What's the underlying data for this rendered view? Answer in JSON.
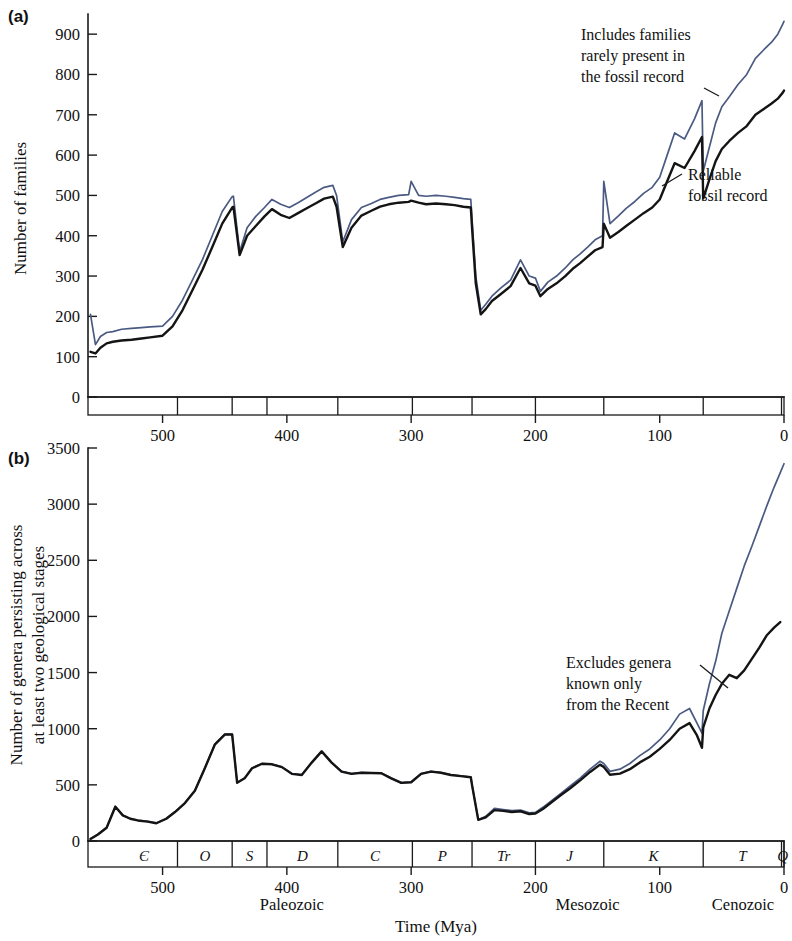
{
  "figure": {
    "panel_a_letter": "(a)",
    "panel_b_letter": "(b)",
    "x_axis_title": "Time (Mya)"
  },
  "panel_a": {
    "ylabel": "Number of families",
    "y_ticks": [
      "0",
      "100",
      "200",
      "300",
      "400",
      "500",
      "600",
      "700",
      "800",
      "900"
    ],
    "x_ticks": [
      "500",
      "400",
      "300",
      "200",
      "100",
      "0"
    ],
    "annotation_upper": [
      "Includes families",
      "rarely present in",
      "the fossil record"
    ],
    "annotation_lower": [
      "Reliable",
      "fossil record"
    ]
  },
  "panel_b": {
    "ylabel_line1": "Number of genera persisting across",
    "ylabel_line2": "at least two geological stages",
    "y_ticks": [
      "0",
      "500",
      "1000",
      "1500",
      "2000",
      "2500",
      "3000",
      "3500"
    ],
    "x_ticks": [
      "500",
      "400",
      "300",
      "200",
      "100",
      "0"
    ],
    "annotation": [
      "Excludes genera",
      "known only",
      "from the Recent"
    ],
    "periods": [
      {
        "symbol": "Є",
        "start": 542,
        "end": 488
      },
      {
        "symbol": "O",
        "start": 488,
        "end": 444
      },
      {
        "symbol": "S",
        "start": 444,
        "end": 416
      },
      {
        "symbol": "D",
        "start": 416,
        "end": 359
      },
      {
        "symbol": "C",
        "start": 359,
        "end": 299
      },
      {
        "symbol": "P",
        "start": 299,
        "end": 251
      },
      {
        "symbol": "Tr",
        "start": 251,
        "end": 200
      },
      {
        "symbol": "J",
        "start": 200,
        "end": 145
      },
      {
        "symbol": "K",
        "start": 145,
        "end": 65
      },
      {
        "symbol": "T",
        "start": 65,
        "end": 2
      },
      {
        "symbol": "Q",
        "start": 2,
        "end": 0
      }
    ],
    "eras": [
      {
        "label": "Paleozoic",
        "center_mya": 396
      },
      {
        "label": "Mesozoic",
        "center_mya": 158
      },
      {
        "label": "Cenozoic",
        "center_mya": 33
      }
    ]
  },
  "colors": {
    "curve_total": "#4a5a82",
    "curve_reliable": "#141414",
    "axis": "#1a1a1a",
    "background": "#ffffff"
  },
  "chart_data": [
    {
      "type": "line",
      "panel": "(a)",
      "title": "",
      "xlabel": "Time (Mya)",
      "ylabel": "Number of families",
      "xlim": [
        560,
        0
      ],
      "ylim": [
        0,
        950
      ],
      "x_reversed": true,
      "grid": false,
      "legend": "annotations",
      "series": [
        {
          "name": "Includes families rarely present in the fossil record",
          "color": "#4a5a82",
          "x": [
            558,
            554,
            550,
            545,
            540,
            533,
            525,
            517,
            510,
            500,
            492,
            484,
            476,
            468,
            460,
            452,
            444,
            443,
            438,
            432,
            425,
            418,
            412,
            405,
            398,
            391,
            384,
            377,
            370,
            363,
            360,
            355,
            348,
            340,
            332,
            325,
            318,
            310,
            302,
            300,
            294,
            288,
            280,
            272,
            265,
            258,
            252,
            251,
            248,
            244,
            240,
            235,
            228,
            220,
            212,
            205,
            200,
            196,
            190,
            183,
            176,
            170,
            164,
            158,
            152,
            146,
            145,
            140,
            133,
            127,
            120,
            113,
            106,
            100,
            94,
            88,
            80,
            72,
            66,
            65,
            60,
            55,
            50,
            44,
            37,
            30,
            23,
            16,
            10,
            5,
            1,
            0
          ],
          "y": [
            205,
            130,
            150,
            160,
            162,
            168,
            170,
            172,
            174,
            176,
            200,
            240,
            290,
            340,
            400,
            460,
            497,
            498,
            360,
            420,
            448,
            470,
            490,
            478,
            470,
            482,
            495,
            508,
            520,
            525,
            500,
            385,
            440,
            470,
            480,
            490,
            495,
            500,
            502,
            535,
            500,
            498,
            500,
            498,
            495,
            492,
            490,
            440,
            300,
            215,
            230,
            250,
            270,
            290,
            340,
            300,
            295,
            262,
            285,
            300,
            320,
            340,
            355,
            372,
            390,
            400,
            535,
            430,
            450,
            468,
            485,
            505,
            520,
            545,
            600,
            655,
            640,
            690,
            735,
            560,
            620,
            680,
            720,
            745,
            775,
            800,
            840,
            862,
            880,
            900,
            925,
            932
          ]
        },
        {
          "name": "Reliable fossil record",
          "color": "#141414",
          "x": [
            558,
            554,
            550,
            545,
            540,
            533,
            525,
            517,
            510,
            500,
            492,
            484,
            476,
            468,
            460,
            452,
            444,
            443,
            438,
            432,
            425,
            418,
            412,
            405,
            398,
            391,
            384,
            377,
            370,
            363,
            360,
            355,
            348,
            340,
            332,
            325,
            318,
            310,
            302,
            300,
            294,
            288,
            280,
            272,
            265,
            258,
            252,
            251,
            248,
            244,
            240,
            235,
            228,
            220,
            212,
            205,
            200,
            196,
            190,
            183,
            176,
            170,
            164,
            158,
            152,
            146,
            145,
            140,
            133,
            127,
            120,
            113,
            106,
            100,
            94,
            88,
            80,
            72,
            66,
            65,
            60,
            55,
            50,
            44,
            37,
            30,
            23,
            16,
            10,
            5,
            1,
            0
          ],
          "y": [
            112,
            108,
            122,
            133,
            137,
            140,
            142,
            145,
            148,
            152,
            175,
            215,
            265,
            315,
            372,
            430,
            470,
            472,
            352,
            400,
            424,
            448,
            466,
            452,
            444,
            456,
            468,
            480,
            492,
            497,
            472,
            372,
            420,
            450,
            462,
            472,
            478,
            482,
            484,
            487,
            482,
            478,
            480,
            478,
            476,
            472,
            470,
            420,
            282,
            205,
            218,
            238,
            255,
            275,
            320,
            282,
            276,
            250,
            268,
            282,
            300,
            318,
            332,
            348,
            364,
            372,
            430,
            395,
            410,
            424,
            440,
            456,
            470,
            490,
            535,
            580,
            568,
            610,
            645,
            492,
            540,
            585,
            615,
            635,
            655,
            672,
            700,
            715,
            728,
            740,
            755,
            760
          ]
        }
      ]
    },
    {
      "type": "line",
      "panel": "(b)",
      "title": "",
      "xlabel": "Time (Mya)",
      "ylabel": "Number of genera persisting across at least two geological stages",
      "xlim": [
        560,
        0
      ],
      "ylim": [
        0,
        3500
      ],
      "x_reversed": true,
      "grid": false,
      "legend": "annotations",
      "series": [
        {
          "name": "Includes genera known only from the Recent",
          "color": "#4a5a82",
          "x": [
            558,
            552,
            545,
            538,
            532,
            526,
            520,
            512,
            505,
            497,
            490,
            482,
            474,
            466,
            458,
            450,
            445,
            444,
            440,
            434,
            428,
            420,
            412,
            404,
            396,
            388,
            380,
            372,
            364,
            356,
            348,
            340,
            332,
            324,
            316,
            308,
            300,
            292,
            284,
            276,
            268,
            260,
            252,
            251,
            246,
            240,
            233,
            226,
            219,
            212,
            205,
            200,
            194,
            187,
            180,
            172,
            164,
            156,
            148,
            145,
            140,
            132,
            124,
            116,
            108,
            100,
            92,
            84,
            76,
            70,
            66,
            65,
            60,
            55,
            50,
            44,
            38,
            32,
            26,
            20,
            14,
            8,
            3,
            0
          ],
          "y": [
            20,
            60,
            120,
            310,
            230,
            200,
            185,
            175,
            160,
            200,
            260,
            340,
            450,
            650,
            860,
            950,
            952,
            950,
            520,
            560,
            650,
            690,
            685,
            660,
            600,
            590,
            700,
            800,
            700,
            620,
            600,
            610,
            608,
            605,
            560,
            520,
            525,
            600,
            620,
            610,
            590,
            580,
            570,
            500,
            190,
            220,
            290,
            280,
            270,
            275,
            250,
            255,
            300,
            360,
            420,
            490,
            560,
            640,
            710,
            690,
            620,
            640,
            690,
            760,
            820,
            900,
            1000,
            1130,
            1180,
            1050,
            960,
            1160,
            1400,
            1600,
            1850,
            2050,
            2250,
            2450,
            2620,
            2800,
            2980,
            3150,
            3280,
            3360
          ]
        },
        {
          "name": "Excludes genera known only from the Recent",
          "color": "#141414",
          "x": [
            558,
            552,
            545,
            538,
            532,
            526,
            520,
            512,
            505,
            497,
            490,
            482,
            474,
            466,
            458,
            450,
            445,
            444,
            440,
            434,
            428,
            420,
            412,
            404,
            396,
            388,
            380,
            372,
            364,
            356,
            348,
            340,
            332,
            324,
            316,
            308,
            300,
            292,
            284,
            276,
            268,
            260,
            252,
            251,
            246,
            240,
            233,
            226,
            219,
            212,
            205,
            200,
            194,
            187,
            180,
            172,
            164,
            156,
            148,
            145,
            140,
            132,
            124,
            116,
            108,
            100,
            92,
            84,
            76,
            70,
            66,
            65,
            60,
            55,
            50,
            44,
            38,
            32,
            26,
            20,
            14,
            8,
            3,
            0
          ],
          "y": [
            18,
            58,
            118,
            305,
            228,
            198,
            183,
            173,
            158,
            198,
            258,
            338,
            448,
            648,
            858,
            948,
            950,
            948,
            518,
            558,
            648,
            688,
            683,
            658,
            598,
            588,
            698,
            798,
            698,
            618,
            598,
            608,
            606,
            603,
            558,
            518,
            523,
            598,
            618,
            608,
            588,
            578,
            568,
            498,
            188,
            210,
            275,
            268,
            258,
            265,
            240,
            245,
            285,
            345,
            405,
            470,
            540,
            615,
            680,
            660,
            590,
            600,
            640,
            700,
            750,
            820,
            900,
            1000,
            1050,
            940,
            830,
            1010,
            1180,
            1300,
            1400,
            1480,
            1450,
            1520,
            1620,
            1720,
            1830,
            1900,
            1950
          ]
        }
      ]
    }
  ]
}
